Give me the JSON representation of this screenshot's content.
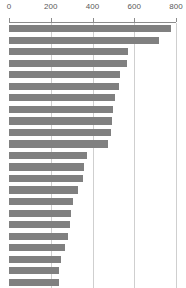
{
  "chart_data": {
    "type": "bar",
    "orientation": "horizontal",
    "title": "",
    "subtitle": "",
    "xlabel": "",
    "ylabel": "",
    "xlim": [
      0,
      800
    ],
    "ylim": null,
    "grid": true,
    "grid_axis": "x",
    "legend": null,
    "legend_position": "none",
    "axis_position": "top",
    "bar_color": "#808080",
    "grid_color": "#cfcfcf",
    "axis_color": "#8c8c8c",
    "tick_label_color": "#5a5a5a",
    "background_color": "#ffffff",
    "xticks": [
      0,
      200,
      400,
      600,
      800
    ],
    "xtick_labels": [
      "0",
      "200",
      "400",
      "600",
      "800"
    ],
    "categories": [
      "",
      "",
      "",
      "",
      "",
      "",
      "",
      "",
      "",
      "",
      "",
      "",
      "",
      "",
      "",
      "",
      "",
      "",
      "",
      "",
      "",
      "",
      ""
    ],
    "values": [
      775,
      720,
      570,
      565,
      530,
      525,
      510,
      500,
      495,
      490,
      475,
      375,
      360,
      355,
      330,
      305,
      295,
      290,
      285,
      270,
      250,
      240,
      238
    ],
    "n_bars": 23
  }
}
